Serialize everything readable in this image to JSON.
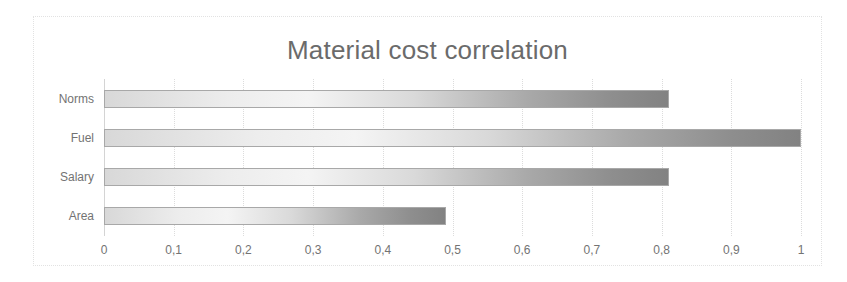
{
  "chart_data": {
    "type": "bar",
    "orientation": "horizontal",
    "title": "Material cost correlation",
    "xlabel": "",
    "ylabel": "",
    "categories": [
      "Norms",
      "Fuel",
      "Salary",
      "Area"
    ],
    "values": [
      0.81,
      1.0,
      0.81,
      0.49
    ],
    "series": [
      {
        "name": "correlation",
        "values": [
          0.81,
          1.0,
          0.81,
          0.49
        ]
      }
    ],
    "xlim": [
      0,
      1
    ],
    "xticks": [
      0,
      0.1,
      0.2,
      0.3,
      0.4,
      0.5,
      0.6,
      0.7,
      0.8,
      0.9,
      1
    ],
    "xtick_labels": [
      "0",
      "0,1",
      "0,2",
      "0,3",
      "0,4",
      "0,5",
      "0,6",
      "0,7",
      "0,8",
      "0,9",
      "1"
    ],
    "decimal_separator": ",",
    "grid": "vertical-only",
    "legend": "none",
    "colors": {
      "title": "#6b6b6b",
      "tick_label": "#737373",
      "gridline": "#dcdcdc",
      "bar_gradient_start": "#d8d8d8",
      "bar_gradient_mid": "#f4f4f4",
      "bar_gradient_end": "#828282",
      "bar_border": "#a8a8a8",
      "frame_border": "#e2e2e2",
      "background": "#ffffff"
    }
  }
}
